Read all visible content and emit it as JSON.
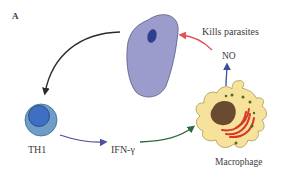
{
  "figure": {
    "panel_label": "A",
    "nodes": {
      "parasite": {
        "label": "",
        "fill": "#9b9ccb",
        "nucleus_fill": "#2f3f8f"
      },
      "th1": {
        "label": "TH1",
        "outer_fill": "#6f9dc6",
        "inner_fill": "#3e6fc2"
      },
      "ifn": {
        "label": "IFN-γ"
      },
      "macrophage": {
        "label": "Macrophage",
        "fill": "#f6e29a",
        "nucleus_fill": "#6b4a32",
        "er_fill": "#d9362b",
        "granule_fill": "#4a6a2a"
      },
      "no": {
        "label": "NO"
      },
      "kills": {
        "label": "Kills parasites"
      }
    },
    "edges": [
      {
        "from": "parasite",
        "to": "th1",
        "color": "#2b2b2b"
      },
      {
        "from": "th1",
        "to": "ifn",
        "color": "#4f4f9a"
      },
      {
        "from": "ifn",
        "to": "macrophage",
        "color": "#2f6a3a"
      },
      {
        "from": "macrophage",
        "to": "no",
        "color": "#3a4fa0"
      },
      {
        "from": "no",
        "to": "parasite",
        "color": "#e4505a",
        "label": "Kills parasites"
      }
    ]
  }
}
